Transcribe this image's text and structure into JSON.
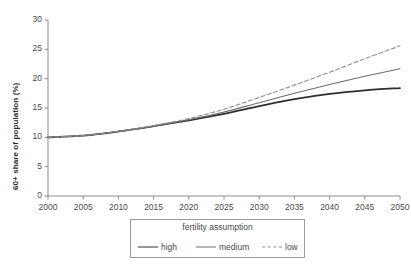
{
  "chart_data": {
    "type": "line",
    "title": "",
    "xlabel": "",
    "ylabel": "60+ share of population (%)",
    "xlim": [
      2000,
      2050
    ],
    "ylim": [
      0,
      30
    ],
    "grid": false,
    "legend_position": "below-center",
    "legend_title": "fertility assumption",
    "x_ticks": [
      2000,
      2005,
      2010,
      2015,
      2020,
      2025,
      2030,
      2035,
      2040,
      2045,
      2050
    ],
    "x_tick_labels": [
      "2000",
      "2005",
      "2010",
      "2015",
      "2020",
      "2025",
      "2030",
      "2035",
      "2040",
      "2045",
      "2050"
    ],
    "y_ticks": [
      0,
      5,
      10,
      15,
      20,
      25,
      30
    ],
    "y_tick_labels": [
      "0",
      "5",
      "10",
      "15",
      "20",
      "25",
      "30"
    ],
    "x": [
      2000,
      2005,
      2010,
      2015,
      2020,
      2025,
      2030,
      2035,
      2040,
      2045,
      2050
    ],
    "series": [
      {
        "name": "high",
        "style": "solid",
        "color": "#2e2e2e",
        "width": 1.8,
        "values": [
          10.0,
          10.3,
          11.0,
          11.9,
          12.9,
          14.0,
          15.3,
          16.5,
          17.4,
          18.0,
          18.4
        ]
      },
      {
        "name": "medium",
        "style": "solid",
        "color": "#6e6e6e",
        "width": 1.1,
        "values": [
          10.0,
          10.3,
          11.0,
          11.9,
          13.0,
          14.3,
          15.9,
          17.5,
          19.0,
          20.4,
          21.7
        ]
      },
      {
        "name": "low",
        "style": "dashed",
        "color": "#8e8e8e",
        "width": 1.1,
        "values": [
          10.0,
          10.3,
          11.0,
          12.0,
          13.2,
          14.8,
          16.8,
          18.9,
          21.1,
          23.4,
          25.6
        ]
      }
    ],
    "legend_entries": [
      {
        "label": "high",
        "style": "solid",
        "color": "#2e2e2e"
      },
      {
        "label": "medium",
        "style": "solid",
        "color": "#6e6e6e"
      },
      {
        "label": "low",
        "style": "dashed",
        "color": "#8e8e8e"
      }
    ],
    "axis_color": "#8c8c8c"
  },
  "plot_geometry": {
    "left": 48,
    "right": 400,
    "top": 20,
    "bottom": 196
  }
}
